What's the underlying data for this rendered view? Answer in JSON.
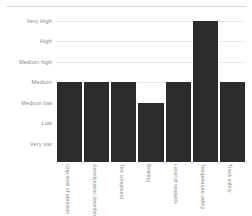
{
  "chart_data": {
    "type": "bar",
    "title": "",
    "xlabel": "",
    "ylabel": "",
    "grid": true,
    "legend": null,
    "orientation": "vertical",
    "bar_color": "#2c2c2c",
    "background_color": "#ffffff",
    "gridline_color": "#e9e9e9",
    "tick_label_color": "#8a8a8a",
    "y_scale": "ordinal",
    "y_categories": [
      "Very High",
      "High",
      "Medium high",
      "Medium",
      "Medium low",
      "Low",
      "Very low"
    ],
    "y_levels_top_to_bottom": [
      "Very High",
      "High",
      "Medium high",
      "Medium",
      "Medium low",
      "Low",
      "Very low"
    ],
    "categories": [
      "Grip level of abrasion",
      "Aerodynamic downforce",
      "Tire compound",
      "Braking",
      "Level of sealants",
      "Temperature safety",
      "Track safety"
    ],
    "values": [
      "Medium",
      "Medium",
      "Medium",
      "Medium low",
      "Medium",
      "Very High",
      "Medium"
    ],
    "values_numeric": [
      4,
      4,
      4,
      3,
      4,
      7,
      4
    ],
    "ylim": [
      0,
      7
    ],
    "bars": [
      {
        "category": "Grip level of abrasion",
        "value": "Medium",
        "level": 4
      },
      {
        "category": "Aerodynamic downforce",
        "value": "Medium",
        "level": 4
      },
      {
        "category": "Tire compound",
        "value": "Medium",
        "level": 4
      },
      {
        "category": "Braking",
        "value": "Medium low",
        "level": 3
      },
      {
        "category": "Level of sealants",
        "value": "Medium",
        "level": 4
      },
      {
        "category": "Temperature safety",
        "value": "Very High",
        "level": 7
      },
      {
        "category": "Track safety",
        "value": "Medium",
        "level": 4
      }
    ]
  }
}
